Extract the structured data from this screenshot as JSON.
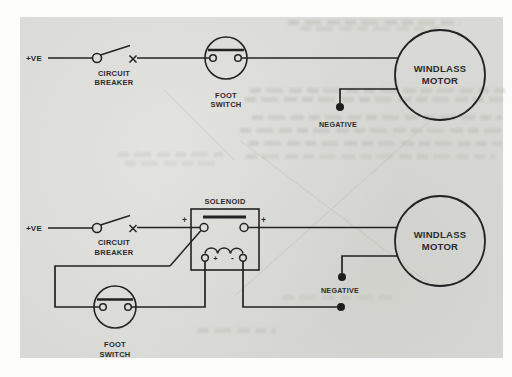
{
  "colors": {
    "paper": "#d9d9d5",
    "ink": "#232323",
    "label_text": "#2b2b2b",
    "page_margin": "#fcfcfb"
  },
  "diagram": {
    "circuit1": {
      "positive": "+VE",
      "breaker": [
        "CIRCUIT",
        "BREAKER"
      ],
      "foot_switch": [
        "FOOT",
        "SWITCH"
      ],
      "motor": [
        "WINDLASS",
        "MOTOR"
      ],
      "negative": "NEGATIVE"
    },
    "circuit2": {
      "positive": "+VE",
      "breaker": [
        "CIRCUIT",
        "BREAKER"
      ],
      "solenoid": "SOLENOID",
      "solenoid_plus_left": "+",
      "solenoid_plus_right": "+",
      "coil_plus": "+",
      "coil_minus": "-",
      "foot_switch": [
        "FOOT",
        "SWITCH"
      ],
      "motor": [
        "WINDLASS",
        "MOTOR"
      ],
      "negative": "NEGATIVE"
    }
  }
}
